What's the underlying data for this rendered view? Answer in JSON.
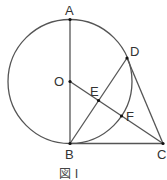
{
  "figure": {
    "caption": "図 I",
    "colors": {
      "line": "#555555",
      "point": "#111111",
      "text": "#333333",
      "background": "#ffffff"
    }
  },
  "points": [
    {
      "id": "A",
      "label": "A"
    },
    {
      "id": "O",
      "label": "O"
    },
    {
      "id": "D",
      "label": "D"
    },
    {
      "id": "E",
      "label": "E"
    },
    {
      "id": "F",
      "label": "F"
    },
    {
      "id": "B",
      "label": "B"
    },
    {
      "id": "C",
      "label": "C"
    }
  ],
  "segments": [
    "AB",
    "BC",
    "BD",
    "DC",
    "OC"
  ],
  "circle": {
    "center": "O",
    "through": [
      "A",
      "B",
      "D",
      "F"
    ]
  }
}
